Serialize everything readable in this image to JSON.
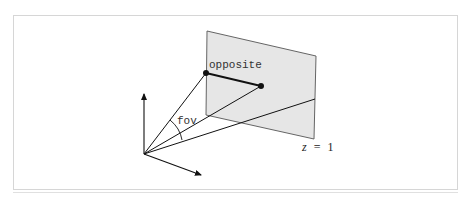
{
  "diagram": {
    "type": "perspective-projection-fov",
    "labels": {
      "opposite": "opposite",
      "fov": "fov",
      "plane_z": "z",
      "plane_eq": "=",
      "plane_value": "1"
    },
    "colors": {
      "plane_fill": "#e6e6e6",
      "plane_stroke": "#555555",
      "line": "#111111",
      "frame": "#d6d6d6"
    },
    "nodes": [
      {
        "id": "origin",
        "x": 144,
        "y": 154
      },
      {
        "id": "opposite-start",
        "x": 206,
        "y": 73
      },
      {
        "id": "opposite-end",
        "x": 261,
        "y": 86
      }
    ],
    "edges": [
      {
        "from": "origin",
        "to": "opposite-start",
        "label": ""
      },
      {
        "from": "origin",
        "to": "opposite-end",
        "label": ""
      },
      {
        "from": "opposite-start",
        "to": "opposite-end",
        "label": "opposite"
      },
      {
        "from": "origin",
        "to": "plane-right-edge",
        "label": ""
      }
    ],
    "axes": [
      {
        "name": "up-axis",
        "tip": [
          144,
          92
        ]
      },
      {
        "name": "right-axis",
        "tip": [
          203,
          176
        ]
      }
    ]
  }
}
